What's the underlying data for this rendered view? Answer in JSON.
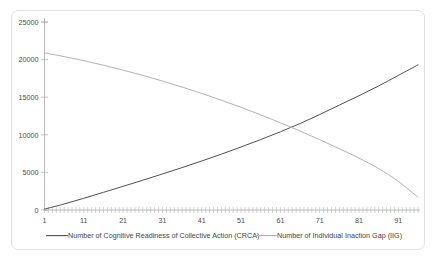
{
  "chart_data": {
    "type": "line",
    "title": "",
    "subtitle": "",
    "xlabel": "",
    "ylabel": "",
    "xlim": [
      1,
      96
    ],
    "ylim": [
      0,
      25000
    ],
    "grid": false,
    "legend_position": "bottom",
    "y_ticks": [
      0,
      5000,
      10000,
      15000,
      20000,
      25000
    ],
    "y_tick_labels": [
      "0",
      "5000",
      "10000",
      "15000",
      "20000",
      "25000"
    ],
    "x_ticks": [
      1,
      11,
      21,
      31,
      41,
      51,
      61,
      71,
      81,
      91
    ],
    "x_tick_labels": [
      "1",
      "11",
      "21",
      "31",
      "41",
      "51",
      "61",
      "71",
      "81",
      "91"
    ],
    "x_minor_tick_step": 1,
    "annotations": [],
    "series": [
      {
        "name": "Number of Cognitive Readiness of Collective Action (CRCA)",
        "color": "#4d4d4d",
        "width": 1.0,
        "x": [
          1,
          6,
          11,
          16,
          21,
          26,
          31,
          36,
          41,
          46,
          51,
          56,
          61,
          66,
          71,
          76,
          81,
          86,
          91,
          96
        ],
        "values": [
          120,
          800,
          1560,
          2350,
          3150,
          3960,
          4790,
          5640,
          6520,
          7430,
          8380,
          9370,
          10400,
          11500,
          12700,
          13950,
          15200,
          16500,
          17900,
          19300
        ]
      },
      {
        "name": "Number of Individual Inaction Gap (IIG)",
        "color": "#b2b2b2",
        "width": 1.0,
        "x": [
          1,
          6,
          11,
          16,
          21,
          26,
          31,
          36,
          41,
          46,
          51,
          56,
          61,
          66,
          71,
          76,
          81,
          86,
          91,
          96
        ],
        "values": [
          20900,
          20400,
          19850,
          19250,
          18600,
          17900,
          17150,
          16350,
          15500,
          14600,
          13650,
          12650,
          11600,
          10500,
          9350,
          8150,
          6900,
          5500,
          3800,
          1700
        ]
      }
    ],
    "legend": [
      {
        "label": "Number of Cognitive Readiness of Collective Action (CRCA)",
        "color": "#4d4d4d"
      },
      {
        "label": "Number of Individual Inaction Gap (IIG)",
        "color": "#b2b2b2"
      }
    ]
  },
  "frame": {
    "border_color": "#e2e2e2",
    "background": "#ffffff"
  }
}
